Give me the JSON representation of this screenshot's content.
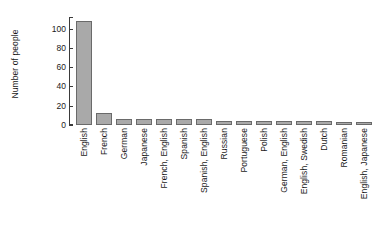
{
  "chart_data": {
    "type": "bar",
    "title": "",
    "subtitle": "",
    "xlabel": "",
    "ylabel": "Number of people",
    "ylim": [
      0,
      112
    ],
    "yticks": [
      0,
      20,
      40,
      60,
      80,
      100
    ],
    "ytick_labels": [
      "0",
      "20",
      "40",
      "60",
      "80",
      "100"
    ],
    "grid": false,
    "legend": false,
    "legend_position": "none",
    "bar_fill_color": "#a9a9a9",
    "bar_border_color": "#6a6a6a",
    "axis_color": "#3a3a3a",
    "background_color": "#ffffff",
    "categories": [
      "English",
      "French",
      "German",
      "Japanese",
      "French, English",
      "Spanish",
      "Spanish, English",
      "Russian",
      "Portuguese",
      "Polish",
      "German, English",
      "English, Swedish",
      "Dutch",
      "Romanian",
      "English, Japanese"
    ],
    "values": [
      108,
      12,
      6,
      6,
      6,
      6,
      6,
      4,
      4,
      4,
      4,
      4,
      4,
      3,
      3
    ]
  }
}
